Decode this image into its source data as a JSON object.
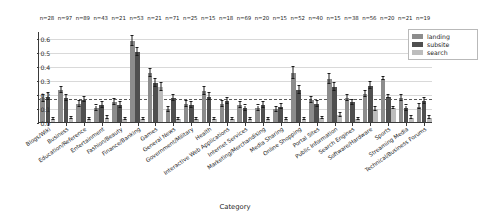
{
  "chart_data": {
    "type": "bar",
    "title": "",
    "xlabel": "Category",
    "ylabel": "Block rate",
    "ylim": [
      0.0,
      0.65
    ],
    "yticks": [
      "0.0",
      "0.1",
      "0.2",
      "0.3",
      "0.4",
      "0.5",
      "0.6"
    ],
    "ytick_values": [
      0.0,
      0.1,
      0.2,
      0.3,
      0.4,
      0.5,
      0.6
    ],
    "grid": true,
    "legend_position": "upper right",
    "reference_line": 0.17,
    "categories": [
      "Blogs/Wiki",
      "Business",
      "Education/Reference",
      "Entertainment",
      "Fashion/Beauty",
      "Finance/Banking",
      "Games",
      "General News",
      "Government/Military",
      "Health",
      "Interactive Web Applications",
      "Internet Services",
      "Marketing/Merchandising",
      "Media Sharing",
      "Online Shopping",
      "Portal Sites",
      "Public Information",
      "Search Engines",
      "Software/Hardware",
      "Sports",
      "Streaming Media",
      "Technical/Business Forums"
    ],
    "sample_sizes": [
      "n=28",
      "n=97",
      "n=89",
      "n=43",
      "n=21",
      "n=53",
      "n=21",
      "n=71",
      "n=25",
      "n=15",
      "n=18",
      "n=69",
      "n=20",
      "n=15",
      "n=52",
      "n=40",
      "n=15",
      "n=38",
      "n=56",
      "n=20",
      "n=21",
      "n=19"
    ],
    "series": [
      {
        "name": "landing",
        "color": "#8c8c8c",
        "values": [
          0.17,
          0.23,
          0.13,
          0.1,
          0.14,
          0.58,
          0.35,
          0.09,
          0.13,
          0.22,
          0.13,
          0.12,
          0.1,
          0.09,
          0.35,
          0.16,
          0.31,
          0.17,
          0.2,
          0.31,
          0.17,
          0.11
        ],
        "errors": [
          0.025,
          0.022,
          0.02,
          0.018,
          0.022,
          0.035,
          0.03,
          0.016,
          0.02,
          0.028,
          0.022,
          0.02,
          0.018,
          0.018,
          0.04,
          0.022,
          0.035,
          0.02,
          0.022,
          0.01,
          0.022,
          0.02
        ]
      },
      {
        "name": "subsite",
        "color": "#4f4f4f",
        "values": [
          0.18,
          0.17,
          0.16,
          0.12,
          0.12,
          0.5,
          0.28,
          0.17,
          0.12,
          0.18,
          0.15,
          0.1,
          0.12,
          0.11,
          0.23,
          0.13,
          0.25,
          0.14,
          0.26,
          0.18,
          0.1,
          0.15
        ],
        "errors": [
          0.025,
          0.02,
          0.02,
          0.02,
          0.02,
          0.03,
          0.028,
          0.022,
          0.02,
          0.025,
          0.022,
          0.018,
          0.02,
          0.02,
          0.03,
          0.02,
          0.03,
          0.02,
          0.025,
          0.01,
          0.018,
          0.022
        ]
      },
      {
        "name": "search",
        "color": "#bdbdbd",
        "values": [
          0.02,
          0.03,
          0.02,
          0.03,
          0.02,
          0.02,
          0.25,
          0.02,
          0.02,
          0.02,
          0.02,
          0.02,
          0.02,
          0.02,
          0.02,
          0.03,
          0.05,
          0.02,
          0.09,
          0.1,
          0.03,
          0.03
        ],
        "errors": [
          0.008,
          0.008,
          0.008,
          0.01,
          0.008,
          0.008,
          0.028,
          0.008,
          0.008,
          0.008,
          0.008,
          0.008,
          0.008,
          0.008,
          0.008,
          0.008,
          0.012,
          0.008,
          0.014,
          0.01,
          0.01,
          0.01
        ]
      }
    ]
  },
  "legend": {
    "items": [
      {
        "label": "landing"
      },
      {
        "label": "subsite"
      },
      {
        "label": "search"
      }
    ]
  }
}
